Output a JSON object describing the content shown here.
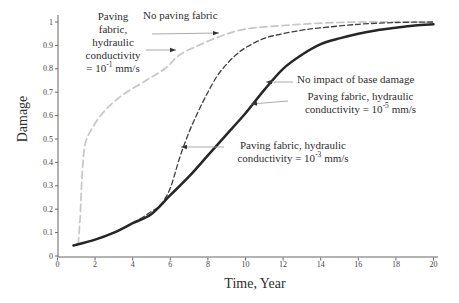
{
  "axes": {
    "x_label": "Time, Year",
    "y_label": "Damage"
  },
  "colors": {
    "background": "#ffffff",
    "axis": "#666666",
    "text": "#2e2e2e",
    "gray_curve": "#c6c6c6",
    "black_dashed_curve": "#3f3f3f",
    "solid_curve": "#262626",
    "arrow_line": "#a0a0a0",
    "arrow_head": "#333333"
  },
  "chart_data": {
    "type": "line",
    "title": "",
    "xlabel": "Time, Year",
    "ylabel": "Damage",
    "xlim": [
      0,
      20
    ],
    "ylim": [
      0,
      1
    ],
    "x_ticks": [
      0,
      2,
      4,
      6,
      8,
      10,
      12,
      14,
      16,
      18,
      20
    ],
    "y_ticks": [
      0,
      0.1,
      0.2,
      0.3,
      0.4,
      0.5,
      0.6,
      0.7,
      0.8,
      0.9,
      1
    ],
    "grid": false,
    "legend_position": "none (curves labeled by arrow annotations)",
    "series": [
      {
        "name": "No paving fabric / Paving fabric, hydraulic conductivity = 10^-1 mm/s (two coinciding curves)",
        "color": "#c6c6c6",
        "dash": "7 4",
        "width": 1.7,
        "points": [
          [
            1.1,
            0.05
          ],
          [
            1.2,
            0.16
          ],
          [
            1.3,
            0.33
          ],
          [
            1.45,
            0.47
          ],
          [
            1.8,
            0.54
          ],
          [
            2.5,
            0.62
          ],
          [
            3.5,
            0.69
          ],
          [
            4.7,
            0.75
          ],
          [
            5.7,
            0.8
          ],
          [
            6.5,
            0.86
          ],
          [
            7.5,
            0.9
          ],
          [
            8.7,
            0.94
          ],
          [
            10,
            0.97
          ],
          [
            12,
            0.985
          ],
          [
            14,
            0.995
          ],
          [
            16,
            1
          ],
          [
            18,
            1
          ],
          [
            20,
            1
          ]
        ]
      },
      {
        "name": "Paving fabric, hydraulic conductivity = 10^-3 mm/s",
        "color": "#3f3f3f",
        "dash": "5 3",
        "width": 1.3,
        "points": [
          [
            0.85,
            0.045
          ],
          [
            2,
            0.07
          ],
          [
            3,
            0.1
          ],
          [
            4,
            0.14
          ],
          [
            5,
            0.19
          ],
          [
            5.5,
            0.22
          ],
          [
            6,
            0.29
          ],
          [
            6.5,
            0.42
          ],
          [
            7,
            0.53
          ],
          [
            7.5,
            0.62
          ],
          [
            8,
            0.7
          ],
          [
            8.5,
            0.77
          ],
          [
            9,
            0.82
          ],
          [
            9.5,
            0.86
          ],
          [
            10,
            0.89
          ],
          [
            11,
            0.93
          ],
          [
            12,
            0.95
          ],
          [
            13,
            0.965
          ],
          [
            14,
            0.975
          ],
          [
            16,
            0.99
          ],
          [
            18,
            0.998
          ],
          [
            20,
            1
          ]
        ]
      },
      {
        "name": "No impact of base damage / Paving fabric, hydraulic conductivity = 10^-5 mm/s (two coinciding curves)",
        "color": "#262626",
        "dash": null,
        "width": 2.5,
        "points": [
          [
            0.85,
            0.045
          ],
          [
            2,
            0.07
          ],
          [
            3,
            0.1
          ],
          [
            4,
            0.14
          ],
          [
            5,
            0.18
          ],
          [
            6,
            0.26
          ],
          [
            7,
            0.34
          ],
          [
            8,
            0.43
          ],
          [
            9,
            0.52
          ],
          [
            10,
            0.61
          ],
          [
            11,
            0.71
          ],
          [
            12,
            0.8
          ],
          [
            13,
            0.86
          ],
          [
            14,
            0.905
          ],
          [
            15,
            0.93
          ],
          [
            16,
            0.95
          ],
          [
            17,
            0.965
          ],
          [
            18,
            0.975
          ],
          [
            19,
            0.985
          ],
          [
            20,
            0.99
          ]
        ]
      }
    ]
  },
  "annotations": [
    {
      "id": "paving-fabric-10-1",
      "lines": [
        [
          {
            "t": "Paving"
          }
        ],
        [
          {
            "t": "fabric,"
          }
        ],
        [
          {
            "t": "hydraulic"
          }
        ],
        [
          {
            "t": "conductivity"
          }
        ],
        [
          {
            "t": "= 10"
          },
          {
            "t": "-1",
            "sup": true
          },
          {
            "t": " mm/s"
          }
        ]
      ],
      "arrow": "points right to light gray dashed curve"
    },
    {
      "id": "no-paving-fabric",
      "lines": [
        [
          {
            "t": "No paving fabric"
          }
        ]
      ],
      "arrow": "points right to light gray dashed curve"
    },
    {
      "id": "no-impact-of-base-damage",
      "lines": [
        [
          {
            "t": "No impact of base damage"
          }
        ]
      ],
      "arrow": "points left to thick solid curve"
    },
    {
      "id": "paving-fabric-10-5",
      "lines": [
        [
          {
            "t": "Paving fabric, hydraulic"
          }
        ],
        [
          {
            "t": "conductivity = 10"
          },
          {
            "t": "-5",
            "sup": true
          },
          {
            "t": " mm/s"
          }
        ]
      ],
      "arrow": "points left to thick solid curve"
    },
    {
      "id": "paving-fabric-10-3",
      "lines": [
        [
          {
            "t": "Paving fabric, hydraulic"
          }
        ],
        [
          {
            "t": "conductivity = 10"
          },
          {
            "t": "-3",
            "sup": true
          },
          {
            "t": " mm/s"
          }
        ]
      ],
      "arrow": "points left to black dashed curve"
    }
  ]
}
